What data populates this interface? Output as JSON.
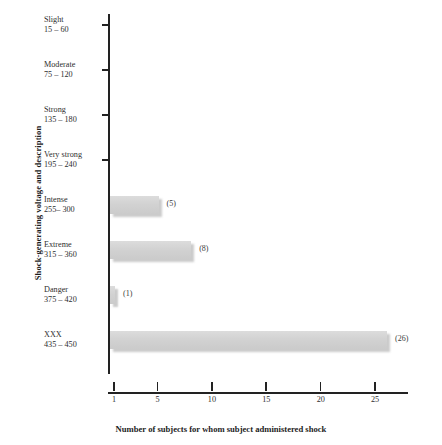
{
  "chart_data": {
    "type": "bar",
    "orientation": "horizontal",
    "title": "",
    "xlabel": "Number of subjects for whom subject administered shock",
    "ylabel": "Shock-generating voltage and description",
    "categories": [
      "Slight",
      "Moderate",
      "Strong",
      "Very strong",
      "Intense",
      "Extreme",
      "Danger",
      "XXX"
    ],
    "category_ranges": [
      "15 – 60",
      "75 – 120",
      "135 – 180",
      "195 – 240",
      "255– 300",
      "315 – 360",
      "375 – 420",
      "435 – 450"
    ],
    "values": [
      0,
      0,
      0,
      0,
      5,
      8,
      1,
      26
    ],
    "value_labels": [
      "",
      "",
      "",
      "",
      "(5)",
      "(8)",
      "(1)",
      "(26)"
    ],
    "xticks": [
      1,
      5,
      10,
      15,
      20,
      25
    ],
    "xtick_labels": [
      "1",
      "5",
      "10",
      "15",
      "20",
      "25"
    ],
    "xlim": [
      0,
      27.5
    ],
    "grid": false,
    "legend": "none",
    "bar_color": "#d4d4d4"
  }
}
